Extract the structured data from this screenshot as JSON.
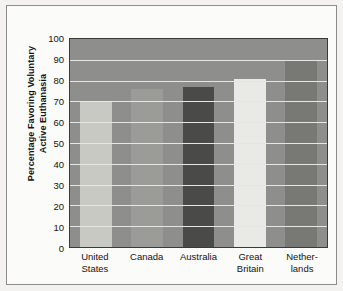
{
  "chart_data": {
    "type": "bar",
    "title": "",
    "xlabel": "",
    "ylabel": "Percentage Favoring Voluntary\nActive Euthanasia",
    "categories": [
      "United\nStates",
      "Canada",
      "Australia",
      "Great\nBritain",
      "Nether-\nlands"
    ],
    "category_names": [
      "United States",
      "Canada",
      "Australia",
      "Great Britain",
      "Netherlands"
    ],
    "values": [
      70,
      76,
      77,
      81,
      90
    ],
    "ylim": [
      0,
      100
    ],
    "ytick_values": [
      100,
      90,
      80,
      70,
      60,
      50,
      40,
      30,
      20,
      10,
      0
    ],
    "ytick_labels": [
      "100",
      "90",
      "80",
      "70",
      "60",
      "50",
      "40",
      "30",
      "20",
      "10",
      "0"
    ],
    "grid": true,
    "grid_axis": "y",
    "legend": false,
    "bar_colors": [
      "#c9c9c4",
      "#9b9b98",
      "#4a4a48",
      "#e9e9e5",
      "#787875"
    ],
    "plot_background": "#8e8e8c",
    "gridline_color": "#e6e6e3",
    "axis_color": "#3a3a38",
    "figure_background": "#fbfbfa",
    "page_background": "#f3f2f0",
    "frame_color": "#8b8b89"
  }
}
